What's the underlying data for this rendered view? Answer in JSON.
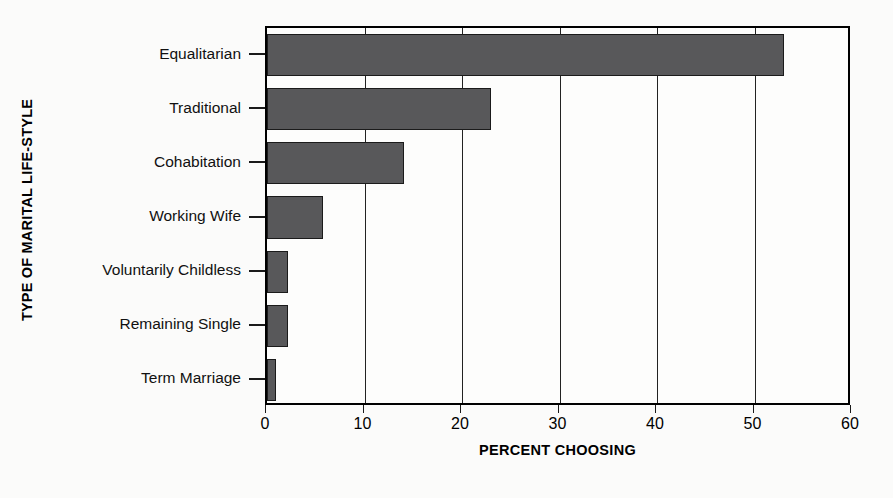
{
  "chart_data": {
    "type": "bar",
    "orientation": "horizontal",
    "title": "",
    "xlabel": "PERCENT CHOOSING",
    "ylabel": "TYPE OF MARITAL LIFE-STYLE",
    "categories": [
      "Equalitarian",
      "Traditional",
      "Cohabitation",
      "Working Wife",
      "Voluntarily Childless",
      "Remaining Single",
      "Term Marriage"
    ],
    "values": [
      53,
      23,
      14,
      5.7,
      2.2,
      2.2,
      0.9
    ],
    "xlim": [
      0,
      60
    ],
    "xticks": [
      0,
      10,
      20,
      30,
      40,
      50,
      60
    ],
    "xtick_labels": [
      "0",
      "10",
      "20",
      "30",
      "40",
      "50",
      "60"
    ],
    "grid": "vertical",
    "legend": "none",
    "bar_color": "#58585a",
    "bar_edge_color": "#1b1b1b",
    "axis_color": "#000000",
    "background": "#fdfdfc"
  }
}
